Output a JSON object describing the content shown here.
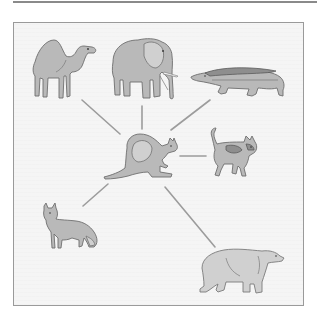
{
  "diagram": {
    "type": "hub-and-spoke",
    "center": {
      "id": "kangaroo",
      "label": "Kangaroo"
    },
    "nodes": [
      {
        "id": "camel",
        "label": "Camel",
        "position": "top-left"
      },
      {
        "id": "elephant",
        "label": "Elephant",
        "position": "top-center"
      },
      {
        "id": "crocodile",
        "label": "Crocodile",
        "position": "top-right"
      },
      {
        "id": "cat",
        "label": "Cat",
        "position": "right"
      },
      {
        "id": "fox",
        "label": "Fox",
        "position": "bottom-left"
      },
      {
        "id": "polar-bear",
        "label": "Polar bear",
        "position": "bottom-right"
      }
    ],
    "edges": [
      {
        "from": "kangaroo",
        "to": "camel"
      },
      {
        "from": "kangaroo",
        "to": "elephant"
      },
      {
        "from": "kangaroo",
        "to": "crocodile"
      },
      {
        "from": "kangaroo",
        "to": "cat"
      },
      {
        "from": "kangaroo",
        "to": "fox"
      },
      {
        "from": "kangaroo",
        "to": "polar-bear"
      }
    ]
  },
  "colors": {
    "background": "#f5f5f5",
    "frame_border": "#9a9a9a",
    "connector": "#9c9c9c",
    "animal_fill": "#b9b9b9",
    "animal_outline": "#6e6e6e"
  }
}
